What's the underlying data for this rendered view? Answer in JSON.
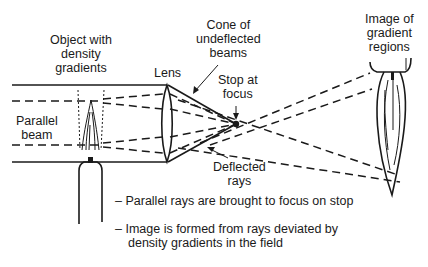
{
  "labels": {
    "object": [
      "Object with",
      "density",
      "gradients"
    ],
    "lens": "Lens",
    "cone": [
      "Cone of",
      "undeflected",
      "beams"
    ],
    "stop": [
      "Stop at",
      "focus"
    ],
    "image": [
      "Image of",
      "gradient",
      "regions"
    ],
    "parallel_beam": [
      "Parallel",
      "beam"
    ],
    "deflected": [
      "Deflected",
      "rays"
    ]
  },
  "notes": [
    {
      "lines": [
        "– Parallel rays are brought to focus on stop"
      ]
    },
    {
      "lines": [
        "– Image is formed from rays deviated by",
        "  density gradients in the field"
      ]
    }
  ],
  "icons": {
    "lens": "lens-icon",
    "flame": "flame-icon",
    "burner": "burner-icon",
    "stop": "stop-dot-icon",
    "image": "flame-image-icon"
  }
}
